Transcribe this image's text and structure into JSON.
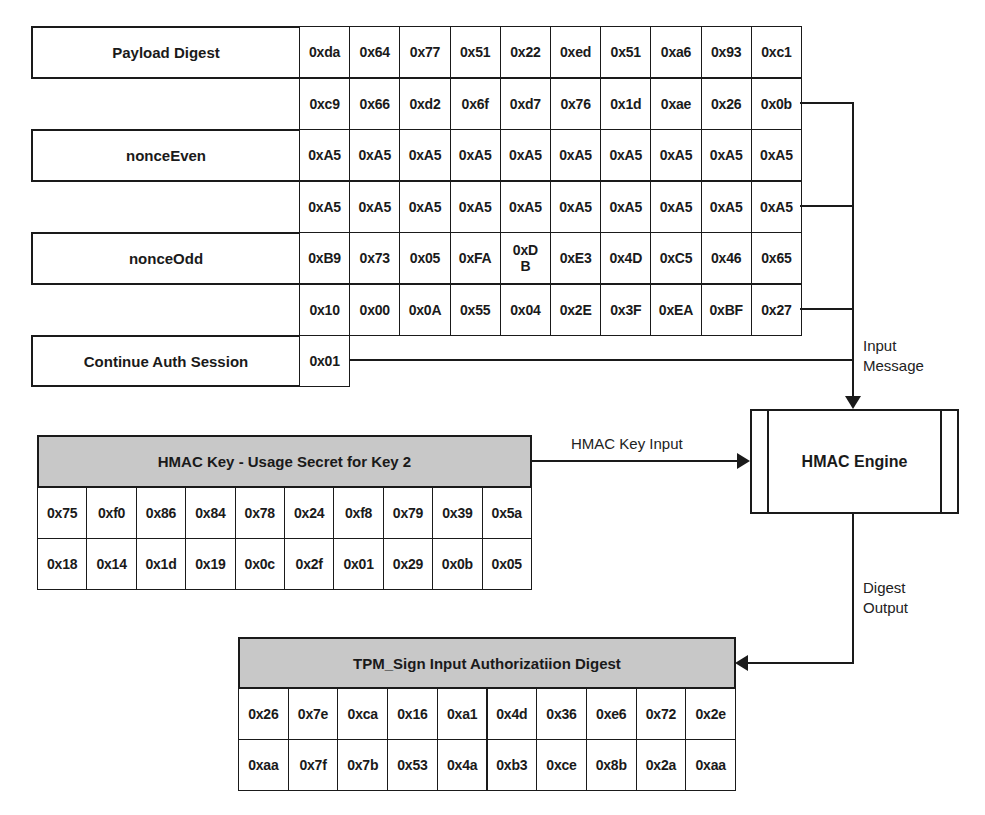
{
  "input_fields": [
    {
      "label": "Payload Digest",
      "rows": [
        [
          "0xda",
          "0x64",
          "0x77",
          "0x51",
          "0x22",
          "0xed",
          "0x51",
          "0xa6",
          "0x93",
          "0xc1"
        ],
        [
          "0xc9",
          "0x66",
          "0xd2",
          "0x6f",
          "0xd7",
          "0x76",
          "0x1d",
          "0xae",
          "0x26",
          "0x0b"
        ]
      ]
    },
    {
      "label": "nonceEven",
      "rows": [
        [
          "0xA5",
          "0xA5",
          "0xA5",
          "0xA5",
          "0xA5",
          "0xA5",
          "0xA5",
          "0xA5",
          "0xA5",
          "0xA5"
        ],
        [
          "0xA5",
          "0xA5",
          "0xA5",
          "0xA5",
          "0xA5",
          "0xA5",
          "0xA5",
          "0xA5",
          "0xA5",
          "0xA5"
        ]
      ]
    },
    {
      "label": "nonceOdd",
      "rows": [
        [
          "0xB9",
          "0x73",
          "0x05",
          "0xFA",
          "0xD B",
          "0xE3",
          "0x4D",
          "0xC5",
          "0x46",
          "0x65"
        ],
        [
          "0x10",
          "0x00",
          "0x0A",
          "0x55",
          "0x04",
          "0x2E",
          "0x3F",
          "0xEA",
          "0xBF",
          "0x27"
        ]
      ]
    },
    {
      "label": "Continue Auth Session",
      "rows": [
        [
          "0x01"
        ]
      ]
    }
  ],
  "hmac_key": {
    "title": "HMAC Key - Usage Secret  for Key 2",
    "rows": [
      [
        "0x75",
        "0xf0",
        "0x86",
        "0x84",
        "0x78",
        "0x24",
        "0xf8",
        "0x79",
        "0x39",
        "0x5a"
      ],
      [
        "0x18",
        "0x14",
        "0x1d",
        "0x19",
        "0x0c",
        "0x2f",
        "0x01",
        "0x29",
        "0x0b",
        "0x05"
      ]
    ]
  },
  "engine": {
    "label": "HMAC Engine"
  },
  "arrows": {
    "input_message": [
      "Input",
      "Message"
    ],
    "key_input": "HMAC Key Input",
    "digest_output": [
      "Digest",
      "Output"
    ]
  },
  "output_digest": {
    "title": "TPM_Sign Input Authorizatiion Digest",
    "rows": [
      [
        "0x26",
        "0x7e",
        "0xca",
        "0x16",
        "0xa1",
        "0x4d",
        "0x36",
        "0xe6",
        "0x72",
        "0x2e"
      ],
      [
        "0xaa",
        "0x7f",
        "0x7b",
        "0x53",
        "0x4a",
        "0xb3",
        "0xce",
        "0x8b",
        "0x2a",
        "0xaa"
      ]
    ]
  },
  "colors": {
    "line": "#1a1a1a",
    "header_fill": "#c8c8c8"
  }
}
